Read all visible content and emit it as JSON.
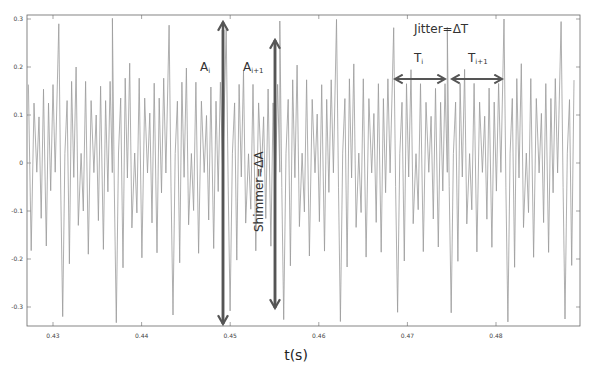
{
  "chart_data": {
    "type": "line",
    "title": "",
    "xlabel": "t(s)",
    "ylabel": "",
    "xlim": [
      0.427,
      0.489
    ],
    "ylim": [
      -0.34,
      0.31
    ],
    "x_ticks": [
      0.43,
      0.44,
      0.45,
      0.46,
      0.47,
      0.48
    ],
    "x_tick_labels": [
      "0.43",
      "0.44",
      "0.45",
      "0.46",
      "0.47",
      "0.48"
    ],
    "y_ticks": [
      0.3,
      0.2,
      0.1,
      0,
      -0.1,
      -0.2,
      -0.3
    ],
    "y_tick_labels": [
      "0.3",
      "0.2",
      "0.1",
      "0",
      "-0.1",
      "-0.2",
      "-0.3"
    ],
    "grid": false,
    "legend": null,
    "series": [
      {
        "name": "speech waveform",
        "color": "#9a9a9a",
        "description": "Quasi-periodic voiced speech signal; period ≈ 0.0063 s, major positive peaks ≈ 0.29, major negative troughs ≈ -0.32",
        "period_s": 0.0063,
        "first_major_peak_s": 0.4305,
        "major_peak_value": 0.29,
        "major_trough_value": -0.32
      }
    ],
    "annotations": [
      {
        "label": "A",
        "sub": "i",
        "type": "vertical-arrow-up",
        "x": 0.4487,
        "y_from": -0.33,
        "y_to": 0.295
      },
      {
        "label": "A",
        "sub": "i+1",
        "type": "vertical-arrow-up",
        "x": 0.4552,
        "y_from": -0.3,
        "y_to": 0.255
      },
      {
        "label": "Shimmer=ΔA",
        "type": "rotated-text"
      },
      {
        "label": "Jitter=ΔT",
        "type": "text"
      },
      {
        "label": "T",
        "sub": "i",
        "type": "double-arrow-horizontal",
        "x_from": 0.4683,
        "x_to": 0.4745
      },
      {
        "label": "T",
        "sub": "i+1",
        "type": "double-arrow-horizontal",
        "x_from": 0.4748,
        "x_to": 0.4808
      }
    ]
  },
  "labels": {
    "a_i": "A",
    "a_i_sub": "i",
    "a_i1": "A",
    "a_i1_sub": "i+1",
    "shimmer": "Shimmer=ΔA",
    "jitter": "Jitter=ΔT",
    "t_i": "T",
    "t_i_sub": "i",
    "t_i1": "T",
    "t_i1_sub": "i+1",
    "xlabel": "t(s)"
  },
  "colors": {
    "waveform": "#9a9a9a",
    "arrow": "#555555",
    "axis": "#555555"
  }
}
